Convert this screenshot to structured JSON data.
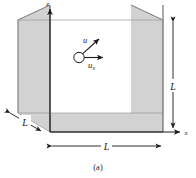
{
  "figure": {
    "caption": "(a)",
    "axes": {
      "vertical_label": "z",
      "horizontal_label": "x"
    },
    "dimensions": {
      "height_label": "L",
      "width_label": "L",
      "depth_label": "L"
    },
    "particle": {
      "velocity_label": "u",
      "velocity_x_label": "u",
      "velocity_x_subscript": "x"
    },
    "colors": {
      "face_shading": "#d2d2d2",
      "outline": "#2b2b2b",
      "interior_line": "#9a9a9a",
      "background": "#ffffff"
    }
  }
}
